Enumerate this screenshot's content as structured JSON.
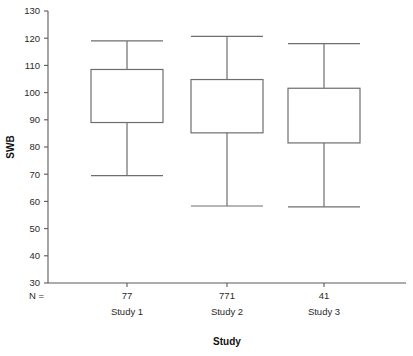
{
  "chart_data": {
    "type": "box",
    "title": "",
    "xlabel": "Study",
    "ylabel": "SWB",
    "ylim": [
      30,
      130
    ],
    "ytick_step": 10,
    "yticks": [
      130,
      120,
      110,
      100,
      90,
      80,
      70,
      60,
      50,
      40,
      30
    ],
    "ytick_labels": [
      "130",
      "120",
      "110",
      "100",
      "90",
      "80",
      "70",
      "60",
      "50",
      "40",
      "30"
    ],
    "grid": false,
    "legend": null,
    "n_prefix": "N =",
    "categories": [
      "Study 1",
      "Study 2",
      "Study 3"
    ],
    "n_values": [
      "77",
      "771",
      "41"
    ],
    "boxes": [
      {
        "category": "Study 1",
        "n": "77",
        "whisker_low": 69.5,
        "q1": 89.0,
        "q3": 108.5,
        "whisker_high": 119.0
      },
      {
        "category": "Study 2",
        "n": "771",
        "whisker_low": 58.3,
        "q1": 85.2,
        "q3": 104.8,
        "whisker_high": 120.7
      },
      {
        "category": "Study 3",
        "n": "41",
        "whisker_low": 58.0,
        "q1": 81.5,
        "q3": 101.6,
        "whisker_high": 118.0
      }
    ],
    "colors": {
      "axis": "#5a5a5a",
      "box_stroke": "#6e6e6e",
      "text": "#2a2a2a",
      "background": "#ffffff"
    }
  }
}
